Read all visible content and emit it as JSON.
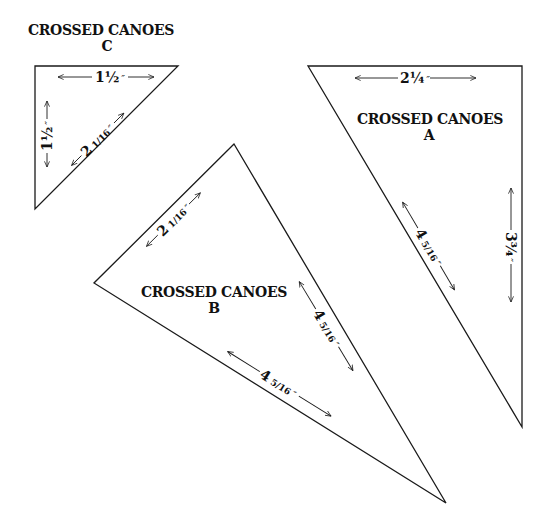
{
  "diagram": {
    "pieces": [
      {
        "id": "C",
        "title_line1": "CROSSED CANOES",
        "title_line2": "C",
        "vertices": [
          [
            35,
            66
          ],
          [
            178,
            66
          ],
          [
            35,
            209
          ]
        ],
        "dims": {
          "top": {
            "whole": "1",
            "frac": "½",
            "mark": "″"
          },
          "left": {
            "whole": "1",
            "frac": "½",
            "mark": "″"
          },
          "hyp": {
            "whole": "2",
            "frac": "1/16",
            "mark": "″"
          }
        }
      },
      {
        "id": "A",
        "title_line1": "CROSSED CANOES",
        "title_line2": "A",
        "vertices": [
          [
            308,
            66
          ],
          [
            522,
            66
          ],
          [
            522,
            427
          ]
        ],
        "dims": {
          "top": {
            "whole": "2",
            "frac": "¼",
            "mark": "″"
          },
          "right": {
            "whole": "3",
            "frac": "¾",
            "mark": "″"
          },
          "hyp": {
            "whole": "4",
            "frac": "5/16",
            "mark": "″"
          }
        }
      },
      {
        "id": "B",
        "title_line1": "CROSSED CANOES",
        "title_line2": "B",
        "vertices": [
          [
            234,
            144
          ],
          [
            94,
            283
          ],
          [
            446,
            503
          ]
        ],
        "dims": {
          "short": {
            "whole": "2",
            "frac": "1/16",
            "mark": "″"
          },
          "right": {
            "whole": "4",
            "frac": "5/16",
            "mark": "″"
          },
          "bottom": {
            "whole": "4",
            "frac": "5/16",
            "mark": "″"
          }
        }
      }
    ],
    "colors": {
      "line": "#1a1a1a",
      "background": "#ffffff"
    }
  }
}
